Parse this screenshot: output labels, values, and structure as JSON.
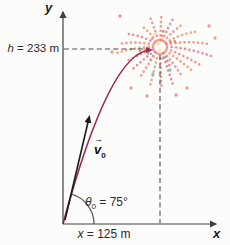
{
  "figure": {
    "title_hint": "projectile-motion-fireworks-diagram",
    "background": "#fcfcfa",
    "colors": {
      "axis": "#3f3f3f",
      "dash": "#4a4a4a",
      "trajectory": "#9c2d55",
      "velocity": "#1a1a1a",
      "text": "#2b2b2b"
    },
    "axes": {
      "x_label": "x",
      "y_label": "y"
    },
    "labels": {
      "height": {
        "variable": "h",
        "rest": " = 233 m"
      },
      "range": {
        "variable": "x",
        "rest": " = 125 m"
      },
      "angle": {
        "variable": "θ",
        "subscript": "0",
        "rest": " = 75°"
      },
      "velocity": {
        "variable": "v",
        "subscript": "0",
        "arrow": "→"
      }
    },
    "firework": {
      "center": {
        "x": 160,
        "y": 47
      },
      "palette": [
        "#f19a8e",
        "#efa87c",
        "#ec8da0",
        "#e8806f",
        "#8fc2b8",
        "#f3e2b8"
      ],
      "streaks": [
        {
          "a": 88,
          "l": 38,
          "g": 6,
          "c": 0
        },
        {
          "a": 70,
          "l": 42,
          "g": 9,
          "c": 2
        },
        {
          "a": 105,
          "l": 40,
          "g": 8,
          "c": 0
        },
        {
          "a": 122,
          "l": 36,
          "g": 9,
          "c": 1
        },
        {
          "a": 55,
          "l": 40,
          "g": 10,
          "c": 0
        },
        {
          "a": 38,
          "l": 46,
          "g": 13,
          "c": 1
        },
        {
          "a": 20,
          "l": 50,
          "g": 14,
          "c": 0
        },
        {
          "a": 3,
          "l": 52,
          "g": 12,
          "c": 2
        },
        {
          "a": 160,
          "l": 44,
          "g": 12,
          "c": 0
        },
        {
          "a": 143,
          "l": 40,
          "g": 11,
          "c": 2
        },
        {
          "a": 176,
          "l": 46,
          "g": 10,
          "c": 1
        },
        {
          "a": 197,
          "l": 36,
          "g": 4,
          "c": 0
        },
        {
          "a": 215,
          "l": 34,
          "g": 3,
          "c": 2
        },
        {
          "a": 235,
          "l": 36,
          "g": 2,
          "c": 0
        },
        {
          "a": 255,
          "l": 40,
          "g": 2,
          "c": 1
        },
        {
          "a": 272,
          "l": 42,
          "g": 0,
          "c": 0
        },
        {
          "a": 290,
          "l": 38,
          "g": 2,
          "c": 2
        },
        {
          "a": 310,
          "l": 36,
          "g": 3,
          "c": 0
        },
        {
          "a": 328,
          "l": 40,
          "g": 4,
          "c": 1
        },
        {
          "a": 345,
          "l": 44,
          "g": 8,
          "c": 0
        },
        {
          "a": 80,
          "l": 20,
          "g": 3,
          "c": 3
        },
        {
          "a": 130,
          "l": 18,
          "g": 3,
          "c": 0
        },
        {
          "a": 30,
          "l": 20,
          "g": 4,
          "c": 3
        },
        {
          "a": 230,
          "l": 18,
          "g": 2,
          "c": 2
        },
        {
          "a": 300,
          "l": 20,
          "g": 2,
          "c": 3
        },
        {
          "a": 180,
          "l": 20,
          "g": 4,
          "c": 0
        }
      ],
      "dots": [
        {
          "x": 215,
          "y": 38,
          "c": 1
        },
        {
          "x": 209,
          "y": 26,
          "c": 0
        },
        {
          "x": 120,
          "y": 16,
          "c": 2
        },
        {
          "x": 112,
          "y": 52,
          "c": 0
        },
        {
          "x": 176,
          "y": 95,
          "c": 2
        },
        {
          "x": 147,
          "y": 96,
          "c": 0
        },
        {
          "x": 187,
          "y": 88,
          "c": 1
        },
        {
          "x": 131,
          "y": 88,
          "c": 0
        },
        {
          "x": 163,
          "y": 58,
          "c": 4
        },
        {
          "x": 148,
          "y": 53,
          "c": 4
        },
        {
          "x": 170,
          "y": 70,
          "c": 4
        },
        {
          "x": 153,
          "y": 74,
          "c": 4
        },
        {
          "x": 158,
          "y": 44,
          "c": 5
        },
        {
          "x": 163,
          "y": 38,
          "c": 5
        },
        {
          "x": 155,
          "y": 34,
          "c": 5
        },
        {
          "x": 160,
          "y": 50,
          "c": 5
        }
      ]
    }
  }
}
